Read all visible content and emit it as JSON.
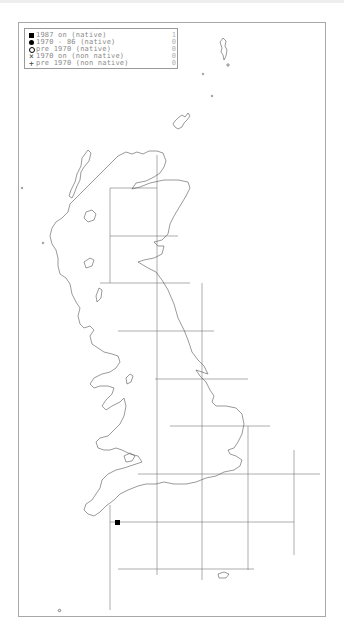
{
  "legend": {
    "items": [
      {
        "symbol": "filled-square",
        "label": "1987 on (native)",
        "count": "1"
      },
      {
        "symbol": "filled-circle",
        "label": "1970 - 86 (native)",
        "count": "0"
      },
      {
        "symbol": "open-circle",
        "label": "pre 1970 (native)",
        "count": "0"
      },
      {
        "symbol": "cross",
        "label": "1970 on (non native)",
        "count": "0"
      },
      {
        "symbol": "plus",
        "label": "pre 1970 (non native)",
        "count": "0"
      }
    ]
  },
  "symbols": {
    "cross": "×",
    "plus": "+"
  },
  "map": {
    "region": "Great Britain",
    "grid_lines_x": [
      110,
      157,
      202,
      248,
      294
    ],
    "grid_lines_y": [
      188,
      236,
      283,
      331,
      379,
      426,
      474,
      522,
      569
    ],
    "records": [
      {
        "type": "1987 on (native)",
        "x": 117,
        "y": 523
      }
    ],
    "colors": {
      "outline": "#555555",
      "grid": "#777777",
      "record": "#000000"
    }
  }
}
